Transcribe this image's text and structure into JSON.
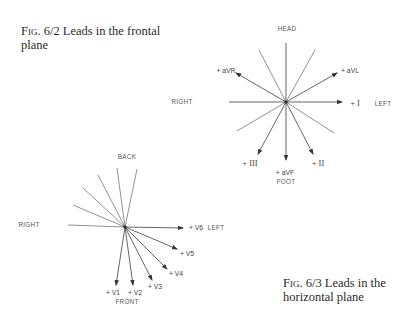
{
  "figures": [
    {
      "id": "fig-6-2",
      "caption_prefix": "Fig. 6/2",
      "caption_text": " Leads in the frontal plane",
      "labels": {
        "top": "HEAD",
        "bottom": "FOOT",
        "left": "RIGHT",
        "right": "LEFT"
      },
      "leads": {
        "I": "+ I",
        "II": "+ II",
        "III": "+ III",
        "aVR": "+ aVR",
        "aVL": "+ aVL",
        "aVF": "+ aVF"
      }
    },
    {
      "id": "fig-6-3",
      "caption_prefix": "Fig. 6/3",
      "caption_text": " Leads in the horizontal plane",
      "labels": {
        "top": "BACK",
        "bottom": "FRONT",
        "left": "RIGHT",
        "right": "LEFT"
      },
      "leads": {
        "V1": "+ V1",
        "V2": "+ V2",
        "V3": "+ V3",
        "V4": "+ V4",
        "V5": "+ V5",
        "V6": "+ V6"
      }
    }
  ]
}
